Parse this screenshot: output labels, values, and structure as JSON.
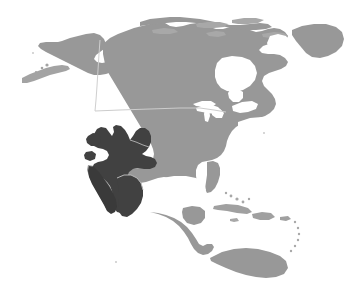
{
  "figure": {
    "kind": "distribution-range-map",
    "region": "North America",
    "width": 346,
    "height": 296,
    "background_color": "#ffffff"
  },
  "colors": {
    "background": "#ffffff",
    "land": "#989898",
    "land_edge": "#8e8e8e",
    "range": "#414141",
    "border_line": "#c8c8c8",
    "island_dots": "#a3a3a3"
  },
  "layers": {
    "land": {
      "name": "landmass",
      "label": "North America landmass",
      "fill": "#989898"
    },
    "range": {
      "name": "species-range",
      "label": "Shaded distribution range (southwestern United States, Baja California and northern-central Mexico)",
      "fill": "#414141"
    },
    "border": {
      "name": "international-border",
      "label": "United States – Canada border (49th parallel)",
      "stroke": "#c8c8c8"
    }
  },
  "geometry": {
    "mainland": "M 96 86 L 96 78 L 90 72 L 84 66 L 78 62 L 72 60 L 66 58 L 60 56 L 56 52 L 52 48 L 48 44 L 46 40 L 48 36 L 54 34 L 60 34 L 66 36 L 72 38 L 78 40 L 84 40 L 90 38 L 96 36 L 100 32 L 104 28 L 110 26 L 118 24 L 126 23 L 134 22 L 142 22 L 150 21 L 158 20 L 166 19 L 174 18 L 182 18 L 190 19 L 198 20 L 206 21 L 214 22 L 222 24 L 230 26 L 238 27 L 246 27 L 254 26 L 262 25 L 270 26 L 278 28 L 286 31 L 292 35 L 296 40 L 298 46 L 299 52 L 300 58 L 302 64 L 304 70 L 306 76 L 307 82 L 306 88 L 303 94 L 299 100 L 295 105 L 290 110 L 285 114 L 279 118 L 273 121 L 267 124 L 261 128 L 256 132 L 251 137 L 246 142 L 241 147 L 236 152 L 231 156 L 226 159 L 221 161 L 216 163 L 211 165 L 206 167 L 201 170 L 197 175 L 194 181 L 192 187 L 190 193 L 187 197 L 183 200 L 178 201 L 173 200 L 168 198 L 163 195 L 158 193 L 153 192 L 148 192 L 144 194 L 141 198 L 139 203 L 138 208 L 138 213 L 140 218 L 143 222 L 147 226 L 151 230 L 155 234 L 158 238 L 160 242 L 161 246 L 160 250 L 157 252 L 153 252 L 149 250 L 145 247 L 141 243 L 137 239 L 133 234 L 129 229 L 125 224 L 121 219 L 117 214 L 113 209 L 110 204 L 107 199 L 104 193 L 102 187 L 100 181 L 99 175 L 98 169 L 97 163 L 96 157 L 95 151 L 94 145 L 93 139 L 92 133 L 91 127 L 90 121 L 89 115 L 89 109 L 90 103 L 92 97 L 94 91 Z",
    "range_polygon": "M 94 133 L 98 128 L 104 126 L 110 126 L 116 128 L 120 132 L 123 137 L 126 133 L 130 129 L 135 127 L 140 128 L 144 132 L 147 137 L 149 143 L 150 149 L 149 155 L 146 160 L 142 164 L 137 167 L 132 169 L 127 171 L 124 175 L 123 180 L 124 186 L 126 192 L 127 198 L 126 204 L 123 209 L 119 212 L 114 213 L 110 211 L 107 207 L 105 202 L 104 196 L 104 190 L 103 184 L 101 179 L 98 175 L 95 171 L 93 166 L 92 161 L 92 155 L 93 149 L 93 143 Z"
  },
  "annotations": {
    "title": "",
    "legend": "",
    "caption": ""
  }
}
